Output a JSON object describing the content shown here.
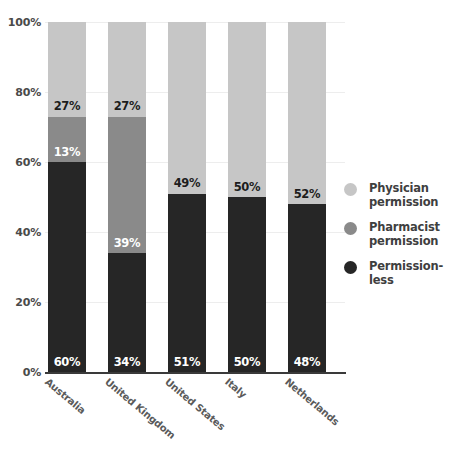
{
  "chart_data": {
    "type": "bar",
    "subtype": "100% stacked bar",
    "title": "",
    "xlabel": "",
    "ylabel": "",
    "ylim": [
      0,
      100
    ],
    "yticks": [
      "0%",
      "20%",
      "40%",
      "60%",
      "80%",
      "100%"
    ],
    "ytick_values": [
      0,
      20,
      40,
      60,
      80,
      100
    ],
    "grid": true,
    "grid_axis": "y",
    "legend_position": "right",
    "categories": [
      "Australia",
      "United Kingdom",
      "United States",
      "Italy",
      "Netherlands"
    ],
    "series": [
      {
        "name": "Physician permission",
        "color": "#c6c6c6",
        "values": [
          27,
          27,
          49,
          50,
          52
        ],
        "labels": [
          "27%",
          "27%",
          "49%",
          "50%",
          "52%"
        ],
        "label_colors": [
          "#1d1d1d",
          "#1d1d1d",
          "#1d1d1d",
          "#1d1d1d",
          "#1d1d1d"
        ]
      },
      {
        "name": "Pharmacist permission",
        "color": "#8a8a8a",
        "values": [
          13,
          39,
          0,
          0,
          0
        ],
        "labels": [
          "13%",
          "39%",
          "",
          "",
          ""
        ],
        "label_colors": [
          "#ffffff",
          "#ffffff",
          "",
          "",
          ""
        ]
      },
      {
        "name": "Permission-less",
        "color": "#262626",
        "values": [
          60,
          34,
          51,
          50,
          48
        ],
        "labels": [
          "60%",
          "34%",
          "51%",
          "50%",
          "48%"
        ],
        "label_colors": [
          "#ffffff",
          "#ffffff",
          "#ffffff",
          "#ffffff",
          "#ffffff"
        ]
      }
    ]
  },
  "legend": {
    "items": [
      {
        "label": "Physician permission",
        "color": "#c6c6c6",
        "icon": "circle-swatch-icon"
      },
      {
        "label": "Pharmacist permission",
        "color": "#8a8a8a",
        "icon": "circle-swatch-icon"
      },
      {
        "label": "Permission-less",
        "color": "#262626",
        "icon": "circle-swatch-icon"
      }
    ]
  },
  "axes": {
    "y_ticks": [
      "100%",
      "80%",
      "60%",
      "40%",
      "20%",
      "0%"
    ],
    "x_categories": [
      "Australia",
      "United Kingdom",
      "United States",
      "Italy",
      "Netherlands"
    ]
  },
  "colors": {
    "physician": "#c6c6c6",
    "pharmacist": "#8a8a8a",
    "permissionless": "#262626",
    "axis": "#3a3a3a",
    "grid": "#ededed",
    "tick_text": "#4a4a4a",
    "category_text": "#5a5a5a"
  }
}
